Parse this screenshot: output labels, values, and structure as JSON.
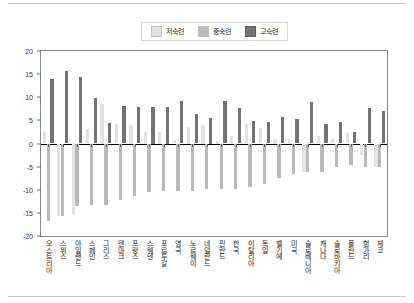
{
  "chart_data": {
    "type": "bar",
    "title": "",
    "xlabel": "",
    "ylabel": "",
    "ylim": [
      -20,
      20
    ],
    "yticks": [
      20,
      15,
      10,
      5,
      0,
      -5,
      -10,
      -15,
      -20
    ],
    "grid": false,
    "legend_position": "top-center",
    "categories": [
      "오스트리아",
      "스위스",
      "아일랜드",
      "스페인",
      "그리스",
      "덴마크",
      "프랑스",
      "스웨덴",
      "포르투갈",
      "영국",
      "노르웨이",
      "네덜란드",
      "핀란드",
      "한국",
      "이탈리아",
      "독일",
      "벨기에",
      "미국",
      "슬로베니아",
      "캐나다",
      "슬로바키아",
      "폴란드",
      "헝가리",
      "체코"
    ],
    "series": [
      {
        "name": "저숙련",
        "color": "#e2e2e2",
        "values": [
          2.7,
          -15.7,
          -15.2,
          3.2,
          8.5,
          4.3,
          4.0,
          2.5,
          2.5,
          0.7,
          3.5,
          4.0,
          0.5,
          1.7,
          4.3,
          3.3,
          1.0,
          1.0,
          -6.2,
          1.6,
          0.9,
          2.3,
          -2.5,
          -5.0
        ]
      },
      {
        "name": "중숙련",
        "color": "#b9b9b9",
        "values": [
          -16.8,
          -15.7,
          -13.6,
          -13.2,
          -13.2,
          -12.2,
          -11.3,
          -10.4,
          -10.2,
          -10.2,
          -10.2,
          -9.8,
          -9.9,
          -9.9,
          -9.4,
          -8.8,
          -7.4,
          -6.5,
          -6.2,
          -6.1,
          -5.1,
          -4.7,
          -5.0,
          -5.0
        ]
      },
      {
        "name": "고숙련",
        "color": "#737373",
        "values": [
          13.9,
          15.6,
          14.4,
          9.9,
          4.4,
          8.1,
          7.9,
          8.0,
          8.0,
          9.1,
          6.3,
          5.5,
          9.1,
          7.7,
          4.8,
          4.7,
          5.8,
          5.2,
          8.9,
          4.3,
          4.6,
          2.4,
          7.6,
          7.1
        ]
      }
    ]
  },
  "legend": {
    "items": [
      {
        "label": "저숙련",
        "color": "#e2e2e2"
      },
      {
        "label": "중숙련",
        "color": "#b9b9b9"
      },
      {
        "label": "고숙련",
        "color": "#737373"
      }
    ]
  }
}
